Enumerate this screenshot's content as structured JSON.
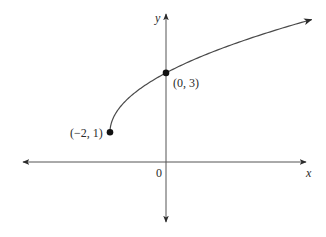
{
  "chart_data": {
    "type": "line",
    "title": "",
    "function": "y = 1 + sqrt(2(x + 2))",
    "xlabel": "x",
    "ylabel": "y",
    "origin_label": "0",
    "grid": false,
    "legend": null,
    "xlim": [
      -5.2,
      5.5
    ],
    "ylim": [
      -2.5,
      5.4
    ],
    "series": [
      {
        "name": "curve",
        "x": [
          -2,
          -1.5,
          -1,
          -0.5,
          0,
          1,
          2,
          3,
          4,
          5,
          5.2
        ],
        "values": [
          1,
          2,
          2.41,
          2.73,
          3,
          3.45,
          3.83,
          4.16,
          4.46,
          4.74,
          4.79
        ]
      }
    ],
    "points": [
      {
        "x": -2,
        "y": 1,
        "label": "(−2, 1)"
      },
      {
        "x": 0,
        "y": 3,
        "label": "(0, 3)"
      }
    ]
  },
  "colors": {
    "axis": "#3a3a3a",
    "curve": "#4a4a4a",
    "point": "#111111",
    "text": "#2a2a2a"
  }
}
